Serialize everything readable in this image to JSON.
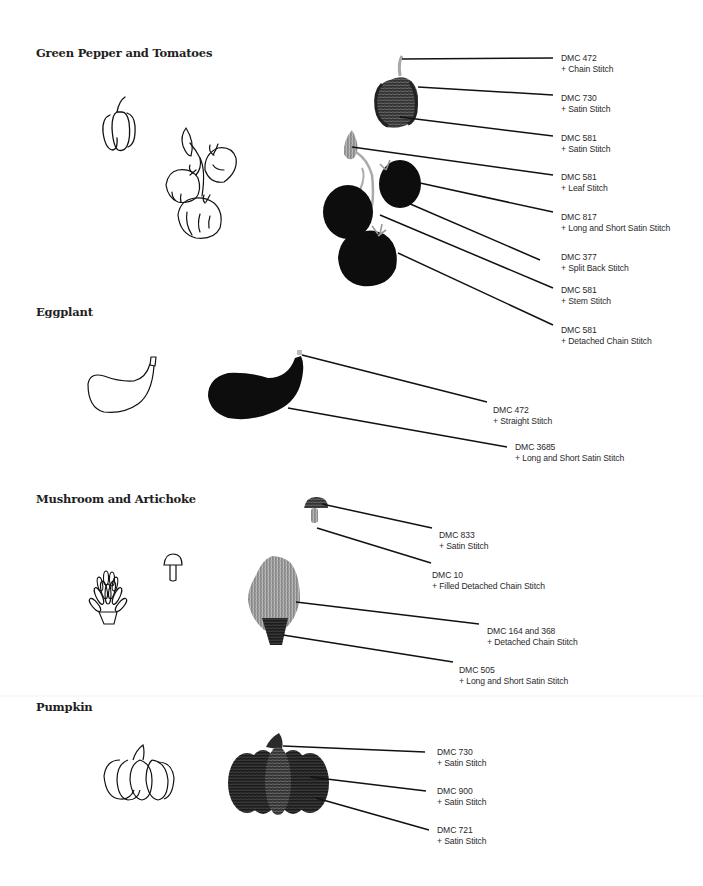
{
  "sections": [
    {
      "title": "Green Pepper and Tomatoes",
      "labels": [
        {
          "thread": "DMC 472",
          "stitch": "+ Chain Stitch"
        },
        {
          "thread": "DMC 730",
          "stitch": "+ Satin Stitch"
        },
        {
          "thread": "DMC 581",
          "stitch": "+ Satin Stitch"
        },
        {
          "thread": "DMC 581",
          "stitch": "+ Leaf Stitch"
        },
        {
          "thread": "DMC 817",
          "stitch": "+ Long and Short Satin Stitch"
        },
        {
          "thread": "DMC 377",
          "stitch": "+ Split Back Stitch"
        },
        {
          "thread": "DMC 581",
          "stitch": "+ Stem Stitch"
        },
        {
          "thread": "DMC 581",
          "stitch": "+ Detached Chain Stitch"
        }
      ]
    },
    {
      "title": "Eggplant",
      "labels": [
        {
          "thread": "DMC 472",
          "stitch": "+ Straight Stitch"
        },
        {
          "thread": "DMC 3685",
          "stitch": "+ Long and Short Satin Stitch"
        }
      ]
    },
    {
      "title": "Mushroom and Artichoke",
      "labels": [
        {
          "thread": "DMC 833",
          "stitch": "+ Satin Stitch"
        },
        {
          "thread": "DMC 10",
          "stitch": "+ Filled Detached Chain Stitch"
        },
        {
          "thread": "DMC 164 and 368",
          "stitch": "+ Detached Chain Stitch"
        },
        {
          "thread": "DMC 505",
          "stitch": "+ Long and Short Satin Stitch"
        }
      ]
    },
    {
      "title": "Pumpkin",
      "labels": [
        {
          "thread": "DMC 730",
          "stitch": "+ Satin Stitch"
        },
        {
          "thread": "DMC 900",
          "stitch": "+ Satin Stitch"
        },
        {
          "thread": "DMC 721",
          "stitch": "+ Satin Stitch"
        }
      ]
    }
  ],
  "colors": {
    "ink": "#111111",
    "embroidery_dark": "#0d0d0d",
    "embroidery_mid": "#3a3a3a",
    "embroidery_light": "#9a9a9a"
  }
}
